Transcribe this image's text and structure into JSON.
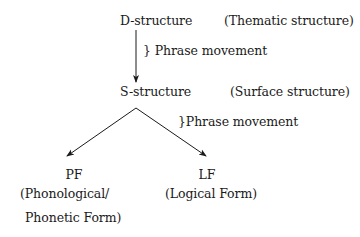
{
  "diagram": {
    "nodes": {
      "d_structure": {
        "label": "D-structure",
        "gloss": "(Thematic structure)"
      },
      "s_structure": {
        "label": "S-structure",
        "gloss": "(Surface structure)"
      },
      "pf": {
        "label": "PF",
        "gloss_line1": "(Phonological/",
        "gloss_line2": "Phonetic Form)"
      },
      "lf": {
        "label": "LF",
        "gloss": "(Logical Form)"
      }
    },
    "edges": {
      "d_to_s": {
        "label": "} Phrase movement"
      },
      "s_to_pf_lf": {
        "label": "}Phrase movement"
      }
    },
    "colors": {
      "text": "#1a1a1a",
      "line": "#1a1a1a",
      "background": "#ffffff"
    }
  }
}
